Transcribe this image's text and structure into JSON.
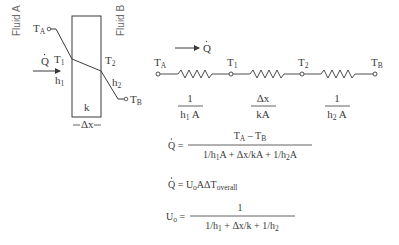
{
  "colors": {
    "stroke": "#3a3a3a",
    "text": "#3a3a3a",
    "side_label": "#6a6a6a",
    "background": "#ffffff"
  },
  "wall_diagram": {
    "fluid_a_label": "Fluid A",
    "fluid_b_label": "Fluid B",
    "t_a": {
      "base": "T",
      "sub": "A"
    },
    "t_1": {
      "base": "T",
      "sub": "1"
    },
    "t_2": {
      "base": "T",
      "sub": "2"
    },
    "t_b": {
      "base": "T",
      "sub": "B"
    },
    "q_dot": "Q",
    "h_1": {
      "base": "h",
      "sub": "1"
    },
    "h_2": {
      "base": "h",
      "sub": "2"
    },
    "conductivity": "k",
    "thickness": "Δx"
  },
  "circuit": {
    "q_dot": "Q",
    "nodes": [
      {
        "base": "T",
        "sub": "A"
      },
      {
        "base": "T",
        "sub": "1"
      },
      {
        "base": "T",
        "sub": "2"
      },
      {
        "base": "T",
        "sub": "B"
      }
    ],
    "resistances": [
      {
        "numerator": "1",
        "den_base": "h",
        "den_sub": "1",
        "den_tail": " A"
      },
      {
        "numerator": "Δx",
        "den_base": "kA",
        "den_sub": "",
        "den_tail": ""
      },
      {
        "numerator": "1",
        "den_base": "h",
        "den_sub": "2",
        "den_tail": " A"
      }
    ]
  },
  "equations": {
    "eq1": {
      "lhs": "Q =",
      "num_a": "T",
      "num_a_sub": "A",
      "num_mid": " – T",
      "num_b_sub": "B",
      "den_1": "1/h",
      "den_1_sub": "1",
      "den_2": "A + Δx/kA + 1/h",
      "den_2_sub": "2",
      "den_3": "A"
    },
    "eq2": {
      "lhs": "Q = ",
      "u": "U",
      "u_sub": "o",
      "rest": "AΔT",
      "rest_sub": "overall"
    },
    "eq3": {
      "lhs_u": "U",
      "lhs_sub": "o",
      "lhs_eq": " =",
      "numerator": "1",
      "den_1": "1/h",
      "den_1_sub": "1",
      "den_2": " + Δx/k + 1/h",
      "den_2_sub": "2"
    }
  }
}
